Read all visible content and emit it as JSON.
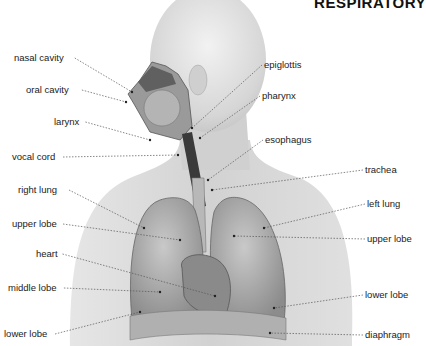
{
  "title": "RESPIRATORY",
  "labels_left": [
    {
      "id": "nasal-cavity",
      "text": "nasal cavity",
      "x": 14,
      "y": 52,
      "tx": 132,
      "ty": 92
    },
    {
      "id": "oral-cavity",
      "text": "oral cavity",
      "x": 26,
      "y": 84,
      "tx": 126,
      "ty": 102
    },
    {
      "id": "larynx",
      "text": "larynx",
      "x": 54,
      "y": 116,
      "tx": 150,
      "ty": 140
    },
    {
      "id": "vocal-cord",
      "text": "vocal cord",
      "x": 12,
      "y": 151,
      "tx": 178,
      "ty": 155
    },
    {
      "id": "right-lung",
      "text": "right lung",
      "x": 18,
      "y": 184,
      "tx": 144,
      "ty": 228
    },
    {
      "id": "upper-lobe-right",
      "text": "upper lobe",
      "x": 12,
      "y": 218,
      "tx": 180,
      "ty": 240
    },
    {
      "id": "heart",
      "text": "heart",
      "x": 36,
      "y": 248,
      "tx": 215,
      "ty": 296
    },
    {
      "id": "middle-lobe",
      "text": "middle lobe",
      "x": 8,
      "y": 282,
      "tx": 160,
      "ty": 292
    },
    {
      "id": "lower-lobe-right",
      "text": "lower lobe",
      "x": 4,
      "y": 328,
      "tx": 140,
      "ty": 312
    }
  ],
  "labels_right": [
    {
      "id": "epiglottis",
      "text": "epiglottis",
      "x": 264,
      "y": 59,
      "tx": 192,
      "ty": 128
    },
    {
      "id": "pharynx",
      "text": "pharynx",
      "x": 262,
      "y": 90,
      "tx": 200,
      "ty": 138
    },
    {
      "id": "esophagus",
      "text": "esophagus",
      "x": 265,
      "y": 134,
      "tx": 208,
      "ty": 180
    },
    {
      "id": "trachea",
      "text": "trachea",
      "x": 365,
      "y": 164,
      "tx": 212,
      "ty": 190
    },
    {
      "id": "left-lung",
      "text": "left lung",
      "x": 367,
      "y": 198,
      "tx": 264,
      "ty": 228
    },
    {
      "id": "upper-lobe-left",
      "text": "upper lobe",
      "x": 367,
      "y": 233,
      "tx": 234,
      "ty": 236
    },
    {
      "id": "lower-lobe-left",
      "text": "lower lobe",
      "x": 365,
      "y": 289,
      "tx": 274,
      "ty": 308
    },
    {
      "id": "diaphragm",
      "text": "diaphragm",
      "x": 365,
      "y": 329,
      "tx": 270,
      "ty": 333
    }
  ]
}
